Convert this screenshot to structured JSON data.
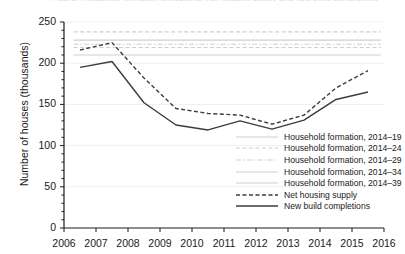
{
  "cut_title": "Figure: Household formation projections, net housing supply and new build completions",
  "axes": {
    "ylabel": "Number of houses (thousands)",
    "yticks": [
      "250",
      "200",
      "150",
      "100",
      "50",
      "0"
    ],
    "xticks": [
      "2006",
      "2007",
      "2008",
      "2009",
      "2010",
      "2011",
      "2012",
      "2013",
      "2014",
      "2015",
      "2016"
    ]
  },
  "legend": {
    "items": [
      {
        "label": "Household formation, 2014–19",
        "style": "solid-light"
      },
      {
        "label": "Household formation, 2014–24",
        "style": "dashed-light"
      },
      {
        "label": "Household formation, 2014–29",
        "style": "dashdot-light"
      },
      {
        "label": "Household formation, 2014–34",
        "style": "solid-light"
      },
      {
        "label": "Household formation, 2014–39",
        "style": "solid-light"
      },
      {
        "label": "Net housing supply",
        "style": "dashed-dark"
      },
      {
        "label": "New build completions",
        "style": "solid-dark"
      }
    ]
  },
  "colors": {
    "axis": "#1a1a1a",
    "series_dark": "#3c3c3c",
    "reference_light": "#cfcfcf",
    "gridline": "#f0f0f0",
    "background": "#ffffff"
  },
  "chart_data": {
    "type": "line",
    "title": "",
    "xlabel": "",
    "ylabel": "Number of houses (thousands)",
    "xlim": [
      2006,
      2016
    ],
    "ylim": [
      0,
      250
    ],
    "yticks": [
      0,
      50,
      100,
      150,
      200,
      250
    ],
    "xticks": [
      2006,
      2007,
      2008,
      2009,
      2010,
      2011,
      2012,
      2013,
      2014,
      2015,
      2016
    ],
    "grid": true,
    "legend_position": "inside-lower-right",
    "x": [
      2006.5,
      2007.5,
      2008.5,
      2009.5,
      2010.5,
      2011.5,
      2012.5,
      2013.5,
      2014.5,
      2015.5
    ],
    "series": [
      {
        "name": "Net housing supply",
        "style": "dashed",
        "color": "#3c3c3c",
        "values": [
          216,
          225,
          182,
          145,
          139,
          137,
          126,
          137,
          170,
          191
        ]
      },
      {
        "name": "New build completions",
        "style": "solid",
        "color": "#3c3c3c",
        "values": [
          195,
          202,
          152,
          125,
          119,
          130,
          120,
          131,
          156,
          165
        ]
      }
    ],
    "reference_lines": [
      {
        "name": "Household formation, 2014–19",
        "value": 210,
        "style": "solid",
        "color": "#cfcfcf",
        "x_from": 2006.3,
        "x_to": 2015.9
      },
      {
        "name": "Household formation, 2014–24",
        "value": 219,
        "style": "dashed",
        "color": "#cfcfcf",
        "x_from": 2006.3,
        "x_to": 2015.9
      },
      {
        "name": "Household formation, 2014–29",
        "value": 223,
        "style": "dashdot",
        "color": "#cfcfcf",
        "x_from": 2006.3,
        "x_to": 2015.9
      },
      {
        "name": "Household formation, 2014–34",
        "value": 228,
        "style": "solid",
        "color": "#cfcfcf",
        "x_from": 2006.3,
        "x_to": 2015.9
      },
      {
        "name": "Household formation, 2014–39",
        "value": 238,
        "style": "dashed",
        "color": "#cfcfcf",
        "x_from": 2006.3,
        "x_to": 2015.9
      }
    ]
  }
}
